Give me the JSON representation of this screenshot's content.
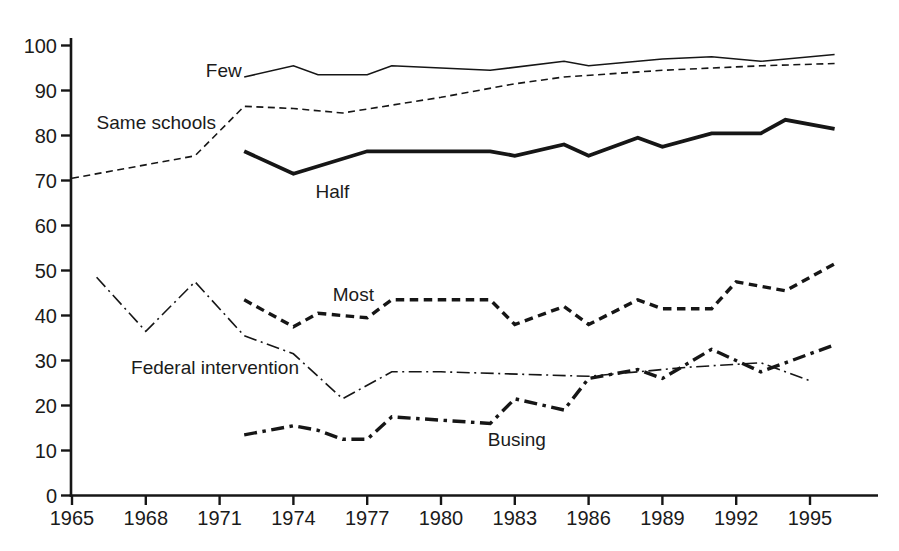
{
  "figure": {
    "background": "#ffffff",
    "ink_color": "#161616"
  },
  "chart_data": {
    "type": "line",
    "title": "",
    "xlabel": "",
    "ylabel": "",
    "grid": false,
    "legend": "inline-labels",
    "x_range": [
      1965,
      1997.5
    ],
    "y_range": [
      0,
      100
    ],
    "x_ticks": [
      1965,
      1968,
      1971,
      1974,
      1977,
      1980,
      1983,
      1986,
      1989,
      1992,
      1995
    ],
    "x_tick_labels": [
      "1965",
      "1968",
      "1971",
      "1974",
      "1977",
      "1980",
      "1983",
      "1986",
      "1989",
      "1992",
      "1995"
    ],
    "y_ticks": [
      0,
      10,
      20,
      30,
      40,
      50,
      60,
      70,
      80,
      90,
      100
    ],
    "y_tick_labels": [
      "0",
      "10",
      "20",
      "30",
      "40",
      "50",
      "60",
      "70",
      "80",
      "90",
      "100"
    ],
    "series": [
      {
        "name": "few",
        "label": "Few",
        "style": "solid-thin",
        "points": [
          [
            1972,
            93
          ],
          [
            1974,
            95.5
          ],
          [
            1975,
            93.5
          ],
          [
            1977,
            93.5
          ],
          [
            1978,
            95.5
          ],
          [
            1980,
            95
          ],
          [
            1982,
            94.5
          ],
          [
            1985,
            96.5
          ],
          [
            1986,
            95.5
          ],
          [
            1989,
            97
          ],
          [
            1991,
            97.5
          ],
          [
            1993,
            96.5
          ],
          [
            1996,
            98
          ]
        ],
        "label_anchor": {
          "year": 1971.9,
          "value": 94.4,
          "align": "end"
        }
      },
      {
        "name": "same-schools",
        "label": "Same schools",
        "style": "dashed-thin",
        "points": [
          [
            1965,
            70.5
          ],
          [
            1970,
            75.5
          ],
          [
            1972,
            86.5
          ],
          [
            1974,
            86
          ],
          [
            1976,
            85
          ],
          [
            1980,
            88.5
          ],
          [
            1983,
            91.5
          ],
          [
            1985,
            93
          ],
          [
            1989,
            94.5
          ],
          [
            1991,
            95
          ],
          [
            1993,
            95.5
          ],
          [
            1996,
            96
          ]
        ],
        "label_anchor": {
          "year": 1966,
          "value": 83,
          "align": "start"
        }
      },
      {
        "name": "half",
        "label": "Half",
        "style": "solid-thick",
        "points": [
          [
            1972,
            76.5
          ],
          [
            1974,
            71.5
          ],
          [
            1977,
            76.5
          ],
          [
            1982,
            76.5
          ],
          [
            1983,
            75.5
          ],
          [
            1985,
            78
          ],
          [
            1986,
            75.5
          ],
          [
            1988,
            79.5
          ],
          [
            1989,
            77.5
          ],
          [
            1991,
            80.5
          ],
          [
            1993,
            80.5
          ],
          [
            1994,
            83.5
          ],
          [
            1996,
            81.5
          ]
        ],
        "label_anchor": {
          "year": 1974.9,
          "value": 67.5,
          "align": "start"
        }
      },
      {
        "name": "most",
        "label": "Most",
        "style": "dashed-thick",
        "points": [
          [
            1972,
            43.5
          ],
          [
            1974,
            37.5
          ],
          [
            1975,
            40.5
          ],
          [
            1977,
            39.5
          ],
          [
            1978,
            43.5
          ],
          [
            1982,
            43.5
          ],
          [
            1983,
            38
          ],
          [
            1985,
            42
          ],
          [
            1986,
            38
          ],
          [
            1988,
            43.5
          ],
          [
            1989,
            41.5
          ],
          [
            1991,
            41.5
          ],
          [
            1992,
            47.5
          ],
          [
            1994,
            45.5
          ],
          [
            1996,
            51.5
          ]
        ],
        "label_anchor": {
          "year": 1975.6,
          "value": 44.6,
          "align": "start"
        }
      },
      {
        "name": "federal-intervention",
        "label": "Federal intervention",
        "style": "dashdot-thin",
        "points": [
          [
            1966,
            48.5
          ],
          [
            1968,
            36.5
          ],
          [
            1970,
            47.5
          ],
          [
            1972,
            35.5
          ],
          [
            1974,
            31.5
          ],
          [
            1976,
            21.5
          ],
          [
            1978,
            27.5
          ],
          [
            1980,
            27.5
          ],
          [
            1986,
            26.5
          ],
          [
            1990,
            28.5
          ],
          [
            1993,
            29.5
          ],
          [
            1995,
            25.5
          ]
        ],
        "label_anchor": {
          "year": 1967.4,
          "value": 28.5,
          "align": "start"
        }
      },
      {
        "name": "busing",
        "label": "Busing",
        "style": "dashdot-thick",
        "points": [
          [
            1972,
            13.5
          ],
          [
            1974,
            15.5
          ],
          [
            1975,
            14.5
          ],
          [
            1976,
            12.5
          ],
          [
            1977,
            12.5
          ],
          [
            1978,
            17.5
          ],
          [
            1982,
            16
          ],
          [
            1983,
            21.5
          ],
          [
            1985,
            19
          ],
          [
            1986,
            26
          ],
          [
            1988,
            28
          ],
          [
            1989,
            26
          ],
          [
            1991,
            32.5
          ],
          [
            1993,
            27.5
          ],
          [
            1996,
            33.5
          ]
        ],
        "label_anchor": {
          "year": 1981.9,
          "value": 12.5,
          "align": "start"
        }
      }
    ]
  }
}
